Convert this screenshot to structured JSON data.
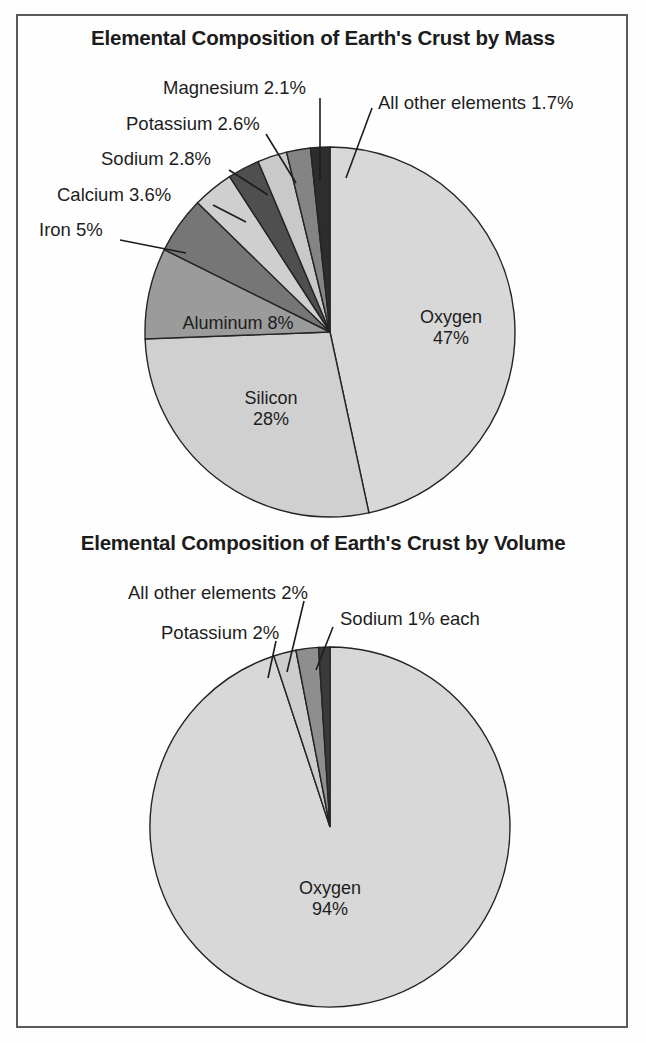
{
  "figure": {
    "background": "#fdfdfd",
    "frame_color": "#5a5a5a"
  },
  "charts": [
    {
      "id": "mass",
      "title": "Elemental Composition of Earth's Crust by Mass",
      "type": "pie",
      "unit": "%",
      "slices": [
        {
          "label": "Oxygen",
          "value": 47,
          "value_text": "47%",
          "color": "#d8d8d8"
        },
        {
          "label": "Silicon",
          "value": 28,
          "value_text": "28%",
          "color": "#d0d0d0"
        },
        {
          "label": "Aluminum",
          "value": 8,
          "value_text": "8%",
          "color": "#9b9b9b"
        },
        {
          "label": "Iron",
          "value": 5,
          "value_text": "5%",
          "color": "#767676"
        },
        {
          "label": "Calcium",
          "value": 3.6,
          "value_text": "3.6%",
          "color": "#cfcfcf"
        },
        {
          "label": "Sodium",
          "value": 2.8,
          "value_text": "2.8%",
          "color": "#4f4f4f"
        },
        {
          "label": "Potassium",
          "value": 2.6,
          "value_text": "2.6%",
          "color": "#c9c9c9"
        },
        {
          "label": "Magnesium",
          "value": 2.1,
          "value_text": "2.1%",
          "color": "#848484"
        },
        {
          "label": "All other elements",
          "value": 1.7,
          "value_text": "1.7%",
          "color": "#2d2d2d"
        }
      ],
      "callouts": [
        {
          "text": "Magnesium 2.1%",
          "name": "callout-magnesium"
        },
        {
          "text": "Potassium 2.6%",
          "name": "callout-potassium"
        },
        {
          "text": "Sodium 2.8%",
          "name": "callout-sodium"
        },
        {
          "text": "Calcium 3.6%",
          "name": "callout-calcium"
        },
        {
          "text": "Iron 5%",
          "name": "callout-iron"
        },
        {
          "text": "All other elements 1.7%",
          "name": "callout-all-other-elements"
        }
      ],
      "inner_labels": [
        {
          "name": "label-oxygen",
          "line1": "Oxygen",
          "line2": "47%"
        },
        {
          "name": "label-silicon",
          "line1": "Silicon",
          "line2": "28%"
        },
        {
          "name": "label-aluminum",
          "line1": "Aluminum 8%",
          "line2": ""
        }
      ]
    },
    {
      "id": "volume",
      "title": "Elemental Composition of Earth's Crust by Volume",
      "type": "pie",
      "unit": "%",
      "slices": [
        {
          "label": "Oxygen",
          "value": 94,
          "value_text": "94%",
          "color": "#d8d8d8"
        },
        {
          "label": "Sodium",
          "value": 1,
          "value_text": "1%",
          "color": "#3a3a3a"
        },
        {
          "label": "All other elements",
          "value": 2,
          "value_text": "2%",
          "color": "#8e8e8e"
        },
        {
          "label": "Potassium",
          "value": 2,
          "value_text": "2%",
          "color": "#cdcdcd"
        }
      ],
      "callouts": [
        {
          "text": "All other elements 2%",
          "name": "callout-all-other-elements-vol"
        },
        {
          "text": "Potassium 2%",
          "name": "callout-potassium-vol"
        },
        {
          "text": "Sodium 1% each",
          "name": "callout-sodium-vol"
        }
      ],
      "inner_labels": [
        {
          "name": "label-oxygen-vol",
          "line1": "Oxygen",
          "line2": "94%"
        }
      ]
    }
  ],
  "chart_data": [
    {
      "type": "pie",
      "title": "Elemental Composition of Earth's Crust by Mass",
      "xlabel": "",
      "ylabel": "",
      "legend": "none",
      "labels": [
        "Oxygen",
        "Silicon",
        "Aluminum",
        "Iron",
        "Calcium",
        "Sodium",
        "Potassium",
        "Magnesium",
        "All other elements"
      ],
      "values": [
        47,
        28,
        8,
        5,
        3.6,
        2.8,
        2.6,
        2.1,
        1.7
      ],
      "value_labels": [
        "47%",
        "28%",
        "8%",
        "5%",
        "3.6%",
        "2.8%",
        "2.6%",
        "2.1%",
        "1.7%"
      ],
      "colors": [
        "#d8d8d8",
        "#d0d0d0",
        "#9b9b9b",
        "#767676",
        "#cfcfcf",
        "#4f4f4f",
        "#c9c9c9",
        "#848484",
        "#2d2d2d"
      ],
      "units": "percent by mass",
      "total": 100
    },
    {
      "type": "pie",
      "title": "Elemental Composition of Earth's Crust by Volume",
      "xlabel": "",
      "ylabel": "",
      "legend": "none",
      "labels": [
        "Oxygen",
        "Potassium",
        "All other elements",
        "Sodium"
      ],
      "values": [
        94,
        2,
        2,
        1
      ],
      "value_labels": [
        "94%",
        "2%",
        "2%",
        "1% each"
      ],
      "colors": [
        "#d8d8d8",
        "#cdcdcd",
        "#8e8e8e",
        "#3a3a3a"
      ],
      "units": "percent by volume",
      "total": 100
    }
  ]
}
